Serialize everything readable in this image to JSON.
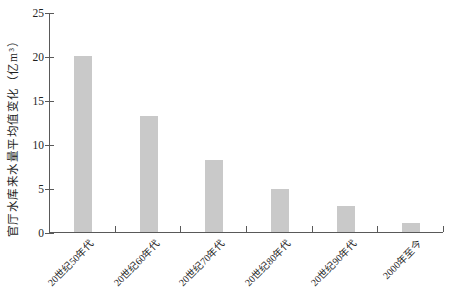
{
  "chart_data": {
    "type": "bar",
    "title": "",
    "categories": [
      "20世纪50年代",
      "20世纪60年代",
      "20世纪70年代",
      "20世纪80年代",
      "20世纪90年代",
      "2000年至今"
    ],
    "values": [
      20,
      13.2,
      8.2,
      4.9,
      3.0,
      1.0
    ],
    "xlabel": "",
    "ylabel": "官厅水库来水量平均值变化（亿m³）",
    "ylim": [
      0,
      25
    ],
    "yticks": [
      0,
      5,
      10,
      15,
      20,
      25
    ],
    "grid": false,
    "legend": null,
    "bar_color": "#c9c9c9",
    "axis_color": "#595959",
    "text_color": "#1f1f1f"
  }
}
